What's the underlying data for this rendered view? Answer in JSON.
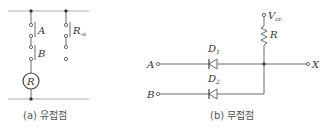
{
  "diagram_a": {
    "caption": "(a) 유접점",
    "contact_1": "A",
    "contact_2": "B",
    "relay_contact": "R",
    "relay_contact_sub": "-a",
    "relay_coil": "R"
  },
  "diagram_b": {
    "caption": "(b) 무접점",
    "supply": "V",
    "supply_sub": "cc",
    "resistor": "R",
    "diode_1": "D",
    "diode_1_sub": "1",
    "diode_2": "D",
    "diode_2_sub": "2",
    "input_a": "A",
    "input_b": "B",
    "output": "X"
  },
  "colors": {
    "line": "#444444",
    "bus": "#999999",
    "text": "#333333"
  }
}
